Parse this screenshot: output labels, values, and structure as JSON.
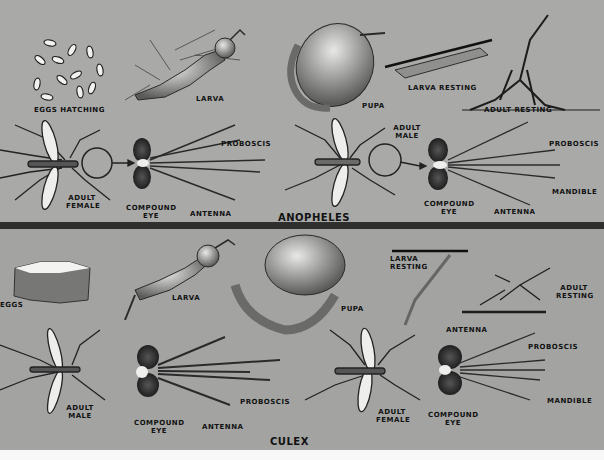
{
  "sections": [
    {
      "id": "anopheles",
      "title": "ANOPHELES",
      "stages": {
        "eggs": "EGGS HATCHING",
        "larva": "LARVA",
        "pupa": "PUPA",
        "larva_resting": "LARVA RESTING",
        "adult_resting": "ADULT RESTING"
      },
      "adults": [
        {
          "sex": "ADULT FEMALE",
          "head_labels": [
            "PROBOSCIS",
            "COMPOUND EYE",
            "ANTENNA"
          ]
        },
        {
          "sex": "ADULT MALE",
          "head_labels": [
            "PROBOSCIS",
            "MANDIBLE",
            "COMPOUND EYE",
            "ANTENNA"
          ]
        }
      ]
    },
    {
      "id": "culex",
      "title": "CULEX",
      "stages": {
        "eggs": "EGGS",
        "larva": "LARVA",
        "pupa": "PUPA",
        "larva_resting": "LARVA RESTING",
        "adult_resting": "ADULT RESTING"
      },
      "adults": [
        {
          "sex": "ADULT MALE",
          "head_labels": [
            "COMPOUND EYE",
            "ANTENNA",
            "PROBOSCIS"
          ]
        },
        {
          "sex": "ADULT FEMALE",
          "head_labels": [
            "ANTENNA",
            "PROBOSCIS",
            "MANDIBLE",
            "COMPOUND EYE"
          ]
        }
      ]
    }
  ],
  "colors": {
    "background": "#a9aaa8",
    "divider": "#2f302e",
    "ink": "#111111"
  }
}
